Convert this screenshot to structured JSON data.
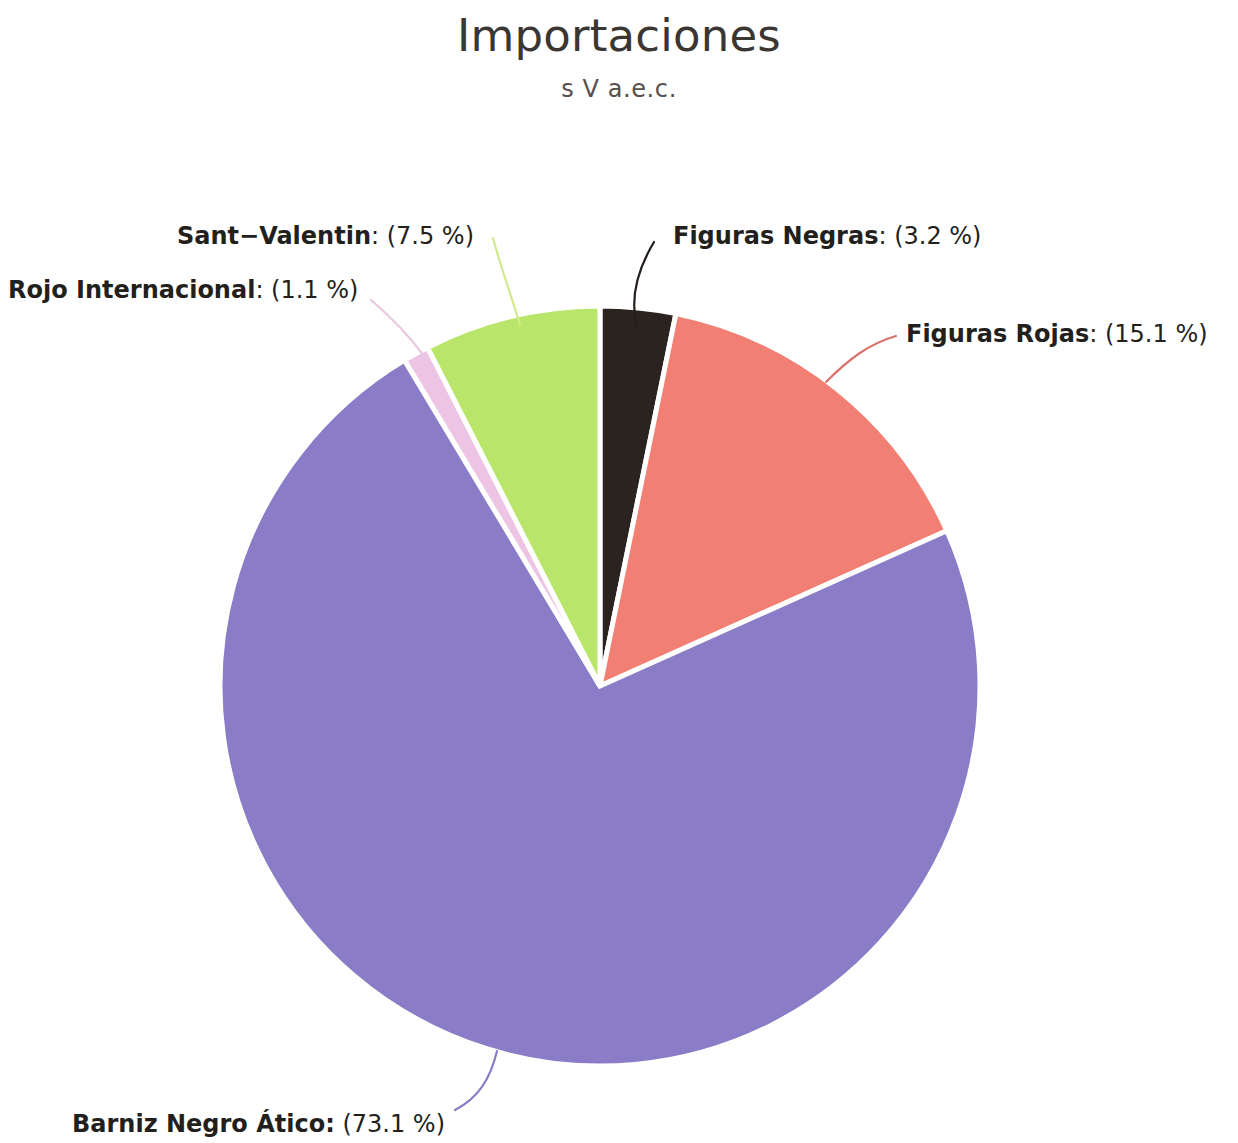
{
  "header": {
    "title": "Importaciones",
    "subtitle": "s V a.e.c."
  },
  "chart_data": {
    "type": "pie",
    "title": "Importaciones",
    "subtitle": "s V a.e.c.",
    "xlabel": "",
    "ylabel": "",
    "unit": "%",
    "legend_position": "callout-labels",
    "grid": false,
    "start_angle_deg": 0,
    "direction": "clockwise",
    "categories": [
      "Figuras Negras",
      "Figuras Rojas",
      "Barniz Negro Ático",
      "Rojo Internacional",
      "Sant-Valentin"
    ],
    "values": [
      3.2,
      15.1,
      73.1,
      1.1,
      7.5
    ],
    "colors": [
      "#2b2320",
      "#f27f74",
      "#8a7cc6",
      "#edc4e4",
      "#b9e66a"
    ],
    "slices": [
      {
        "name": "Figuras Negras",
        "value": 3.2,
        "value_text": "3.2 %",
        "label": "Figuras Negras: (3.2 %)",
        "color": "#2b2320",
        "leader_color": "#241e1b"
      },
      {
        "name": "Figuras Rojas",
        "value": 15.1,
        "value_text": "15.1 %",
        "label": "Figuras Rojas: (15.1 %)",
        "color": "#f27f74",
        "leader_color": "#d9736c"
      },
      {
        "name": "Barniz Negro Ático",
        "value": 73.1,
        "value_text": "73.1 %",
        "label": "Barniz Negro Ático: (73.1 %)",
        "color": "#8a7cc6",
        "leader_color": "#8a7cc6"
      },
      {
        "name": "Rojo Internacional",
        "value": 1.1,
        "value_text": "1.1 %",
        "label": "Rojo Internacional: (1.1 %)",
        "color": "#edc4e4",
        "leader_color": "#e6c6e0"
      },
      {
        "name": "Sant-Valentin",
        "value": 7.5,
        "value_text": "7.5 %",
        "label": "Sant-Valentin: (7.5 %)",
        "color": "#b9e66a",
        "leader_color": "#d2e98f"
      }
    ]
  },
  "labels": {
    "figuras_negras": {
      "name": "Figuras Negras",
      "separator": ": ",
      "pct": "(3.2 %)"
    },
    "figuras_rojas": {
      "name": "Figuras Rojas",
      "separator": ": ",
      "pct": "(15.1 %)"
    },
    "barniz_negro_atico": {
      "name": "Barniz Negro Ático:",
      "separator": " ",
      "pct": "(73.1 %)"
    },
    "rojo_internacional": {
      "name": "Rojo Internacional",
      "separator": ": ",
      "pct": "(1.1 %)"
    },
    "sant_valentin": {
      "name": "Sant−Valentin",
      "separator": ": ",
      "pct": "(7.5 %)"
    }
  }
}
